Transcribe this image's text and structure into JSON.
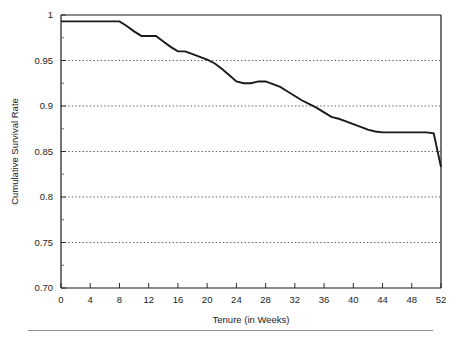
{
  "figure": {
    "background": "#ffffff",
    "line_color": "#1a1a1a",
    "grid_color": "#4d4d4d",
    "axis_color": "#1a1a1a"
  },
  "chart_data": {
    "type": "line",
    "title": "",
    "subtitle": "",
    "xlabel": "Tenure (in Weeks)",
    "ylabel": "Cumulative Survival Rate",
    "xlim": [
      0,
      52
    ],
    "ylim": [
      0.7,
      1.0
    ],
    "grid": true,
    "grid_axis": "y",
    "legend": false,
    "legend_position": "none",
    "x_ticks": [
      0,
      4,
      8,
      12,
      16,
      20,
      24,
      28,
      32,
      36,
      40,
      44,
      48,
      52
    ],
    "x_tick_labels": [
      "0",
      "4",
      "8",
      "12",
      "16",
      "20",
      "24",
      "28",
      "32",
      "36",
      "40",
      "44",
      "48",
      "52"
    ],
    "y_ticks": [
      0.7,
      0.75,
      0.8,
      0.85,
      0.9,
      0.95,
      1.0
    ],
    "y_tick_labels": [
      "0.70",
      "0.75",
      "0.8",
      "0.85",
      "0.9",
      "0.95",
      "1"
    ],
    "y_minor_ticks": [
      0.725,
      0.775,
      0.825,
      0.875,
      0.925,
      0.975
    ],
    "gridlines_at": [
      0.75,
      0.8,
      0.85,
      0.9,
      0.95
    ],
    "series": [
      {
        "name": "Cumulative Survival Rate",
        "color": "#1a1a1a",
        "x": [
          0,
          1,
          2,
          3,
          4,
          5,
          6,
          7,
          8,
          9,
          10,
          11,
          12,
          13,
          14,
          15,
          16,
          17,
          18,
          19,
          20,
          21,
          22,
          23,
          24,
          25,
          26,
          27,
          28,
          29,
          30,
          31,
          32,
          33,
          34,
          35,
          36,
          37,
          38,
          39,
          40,
          41,
          42,
          43,
          44,
          45,
          46,
          47,
          48,
          49,
          50,
          51,
          52
        ],
        "values": [
          0.993,
          0.993,
          0.993,
          0.993,
          0.993,
          0.993,
          0.993,
          0.993,
          0.993,
          0.988,
          0.982,
          0.977,
          0.977,
          0.977,
          0.971,
          0.965,
          0.96,
          0.96,
          0.957,
          0.954,
          0.951,
          0.947,
          0.941,
          0.934,
          0.927,
          0.925,
          0.925,
          0.927,
          0.927,
          0.924,
          0.921,
          0.916,
          0.911,
          0.906,
          0.902,
          0.898,
          0.893,
          0.888,
          0.886,
          0.883,
          0.88,
          0.877,
          0.874,
          0.872,
          0.871,
          0.871,
          0.871,
          0.871,
          0.871,
          0.871,
          0.871,
          0.87,
          0.833
        ]
      }
    ]
  }
}
